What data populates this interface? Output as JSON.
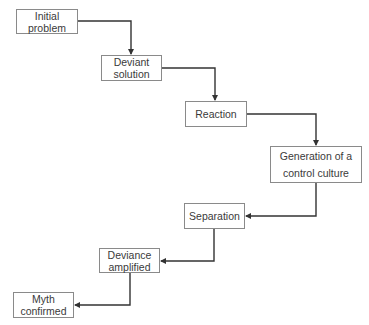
{
  "diagram": {
    "type": "flowchart",
    "nodes": [
      {
        "id": "n1",
        "label": "Initial\nproblem"
      },
      {
        "id": "n2",
        "label": "Deviant\nsolution"
      },
      {
        "id": "n3",
        "label": "Reaction"
      },
      {
        "id": "n4",
        "label": "Generation of a\ncontrol culture"
      },
      {
        "id": "n5",
        "label": "Separation"
      },
      {
        "id": "n6",
        "label": "Deviance\namplified"
      },
      {
        "id": "n7",
        "label": "Myth\nconfirmed"
      }
    ],
    "edges": [
      {
        "from": "Initial problem",
        "to": "Deviant solution"
      },
      {
        "from": "Deviant solution",
        "to": "Reaction"
      },
      {
        "from": "Reaction",
        "to": "Generation of a control culture"
      },
      {
        "from": "Generation of a control culture",
        "to": "Separation"
      },
      {
        "from": "Separation",
        "to": "Deviance amplified"
      },
      {
        "from": "Deviance amplified",
        "to": "Myth confirmed"
      }
    ],
    "colors": {
      "line": "#333333",
      "box_border": "#8a8a8a",
      "text": "#3a3a3a",
      "background": "#ffffff"
    }
  }
}
